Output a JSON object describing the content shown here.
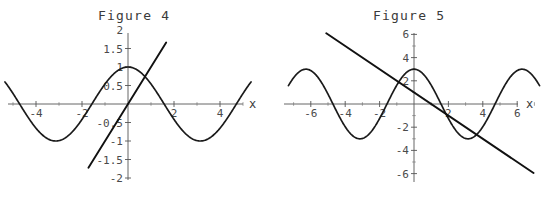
{
  "page": {
    "background": "#ffffff",
    "curve_color": "#1a1a1a",
    "axis_color": "#555555",
    "label_color": "#4a4a4a"
  },
  "figures": [
    {
      "id": "fig4",
      "title": "Figure 4",
      "x_axis_name": "x",
      "chart_data": {
        "type": "line",
        "title": "Figure 4",
        "xlabel": "x",
        "ylabel": "",
        "grid": false,
        "legend": "none",
        "xlim": [
          -5.4,
          5.4
        ],
        "ylim": [
          -2,
          2
        ],
        "xticks": [
          -4,
          -2,
          2,
          4
        ],
        "xtick_labels": [
          "-4",
          "-2",
          "2",
          "4"
        ],
        "yticks": [
          2,
          1.5,
          1,
          0.5,
          -0.5,
          -1,
          -1.5,
          -2
        ],
        "ytick_labels": [
          "2",
          "1.5",
          "1",
          "0.5",
          "-0.5",
          "-1",
          "-1.5",
          "-2"
        ],
        "series": [
          {
            "name": "cos(x)",
            "kind": "curve",
            "expression": "cos(x)",
            "amplitude": 1,
            "period": 6.2832,
            "phase": 0,
            "x_start": -5.35,
            "x_end": 5.35
          },
          {
            "name": "x",
            "kind": "straight",
            "expression": "y = x",
            "slope": 1,
            "intercept": 0,
            "x_start": -1.72,
            "x_end": 1.66
          }
        ],
        "intersections": [
          {
            "x": 0.739,
            "y": 0.739
          }
        ]
      }
    },
    {
      "id": "fig5",
      "title": "Figure 5",
      "x_axis_name": "x",
      "chart_data": {
        "type": "line",
        "title": "Figure 5",
        "xlabel": "x",
        "ylabel": "",
        "grid": false,
        "legend": "none",
        "xlim": [
          -7.4,
          7.4
        ],
        "ylim": [
          -7,
          7
        ],
        "xticks": [
          -6,
          -4,
          -2,
          2,
          4,
          6
        ],
        "xtick_labels": [
          "-6",
          "-4",
          "-2",
          "2",
          "4",
          "6"
        ],
        "yticks": [
          6,
          4,
          2,
          -2,
          -4,
          -6
        ],
        "ytick_labels": [
          "6",
          "4",
          "2",
          "-2",
          "-4",
          "-6"
        ],
        "series": [
          {
            "name": "3cos(x)",
            "kind": "curve",
            "expression": "3 cos(x)",
            "amplitude": 3,
            "period": 6.2832,
            "phase": 0,
            "x_start": -7.3,
            "x_end": 7.3
          },
          {
            "name": "1 - x",
            "kind": "straight",
            "expression": "y = 1 - x",
            "slope": -1,
            "intercept": 1,
            "x_start": -5.1,
            "x_end": 6.95
          }
        ],
        "intersections": [
          {
            "x": 1.62,
            "y": -0.62
          }
        ]
      }
    }
  ]
}
